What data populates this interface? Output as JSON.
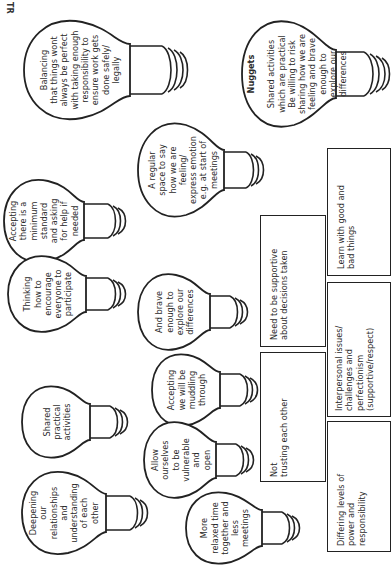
{
  "corner_label": "TR",
  "bulbs": [
    {
      "id": "balancing",
      "text": "Balancing\nthat things wont\nalways be perfect\nwith taking enough\nresponsibility to\nensure work gets\ndone safely/\nlegally"
    },
    {
      "id": "nuggets",
      "title": "Nuggets",
      "text": "Shared activities\nwhich are practical\nBe willing to risk\nsharing how we are\nfeeling and brave\nenough to\nexplore our\ndifferences"
    },
    {
      "id": "accepting-minimum",
      "text": "Accepting\nthere is a\nminimum\nstandard\nand asking\nfor help if\nneeded"
    },
    {
      "id": "regular-space",
      "text": "A regular\nspace to say\nhow we are\nfeeling/\nexpress emotion\ne.g. at start of\nmeetings"
    },
    {
      "id": "thinking",
      "text": "Thinking\nhow to\nencourage\neveryone to\nparticipate"
    },
    {
      "id": "brave",
      "text": "And brave\nenough to\nexplore our\ndifferences"
    },
    {
      "id": "shared-practical",
      "text": "Shared\npractical\nactivities"
    },
    {
      "id": "muddling",
      "text": "Accepting\nwe will be\nmuddling\nthrough"
    },
    {
      "id": "deepening",
      "text": "Deepening\nour\nrelationships\nand\nunderstanding\nof each\nother"
    },
    {
      "id": "vulnerable",
      "text": "Allow\nourselves\nto be\nvulnerable\nand\nopen"
    },
    {
      "id": "relaxed",
      "text": "More\nrelaxed time\ntogether and\nless\nmeetings"
    }
  ],
  "boxes": [
    {
      "id": "supportive",
      "text": "Need to be supportive\nabout decisions taken"
    },
    {
      "id": "not-trusting",
      "text": "Not\ntrusting each other"
    },
    {
      "id": "learn",
      "text": "Learn with good and\nbad things"
    },
    {
      "id": "interpersonal",
      "text": "Interpersonal issues/\nchallenges and\nperfectionism\n(supportive/respect)"
    },
    {
      "id": "differing",
      "text": "Differing levels of\npower and\nresponsibility"
    }
  ]
}
